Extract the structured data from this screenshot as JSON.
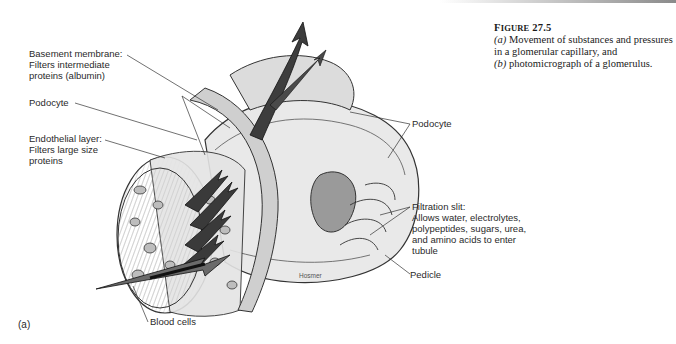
{
  "figure": {
    "number_prefix": "F",
    "number_smallcaps": "IGURE",
    "number": "27.5",
    "caption_lines": [
      {
        "part": "(a)",
        "text": " Movement of substances and pressures"
      },
      {
        "part": "",
        "text": "in a glomerular capillary, and"
      },
      {
        "part": "(b)",
        "text": " photomicrograph of a glomerulus."
      }
    ],
    "panel_label": "(a)",
    "artist_credit": "Hosmer"
  },
  "labels": {
    "basement_membrane": "Basement membrane:\nFilters intermediate\nproteins (albumin)",
    "podocyte_left": "Podocyte",
    "endothelial_layer": "Endothelial layer:\nFilters large size\nproteins",
    "podocyte_right": "Podocyte",
    "filtration_slit": "Filtration slit:\nAllows water, electrolytes,\npolypeptides, sugars, urea,\nand amino acids to enter\ntubule",
    "pedicle": "Pedicle",
    "blood_cells": "Blood cells"
  }
}
